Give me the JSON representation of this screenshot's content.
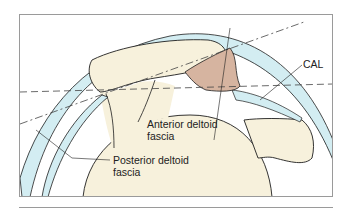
{
  "diagram": {
    "type": "anatomical-illustration",
    "labels": {
      "cal": "CAL",
      "anterior_line1": "Anterior deltoid",
      "anterior_line2": "fascia",
      "posterior_line1": "Posterior deltoid",
      "posterior_line2": "fascia"
    },
    "colors": {
      "background": "#ffffff",
      "frame": "#9a9a9a",
      "bone": "#f7f1dc",
      "fascia": "#d3edf2",
      "ligament": "#d6b4a0",
      "outline": "#1e1e1e",
      "guide_line": "#444444"
    }
  }
}
